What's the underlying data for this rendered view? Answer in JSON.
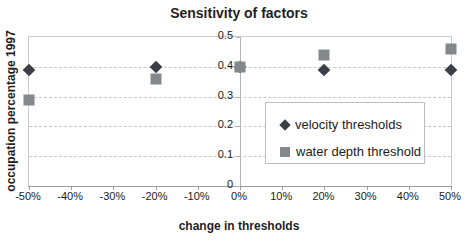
{
  "chart": {
    "title": "Sensitivity of factors",
    "xlabel": "change in thresholds",
    "ylabel": "occupation percentage 1997"
  },
  "chart_data": {
    "type": "scatter",
    "x": [
      -50,
      -20,
      0,
      20,
      50
    ],
    "series": [
      {
        "name": "velocity thresholds",
        "marker": "diamond",
        "color": "#3b3e45",
        "values": [
          0.39,
          0.4,
          0.4,
          0.39,
          0.39
        ]
      },
      {
        "name": "water depth threshold",
        "marker": "square",
        "color": "#85878b",
        "values": [
          0.29,
          0.36,
          0.4,
          0.44,
          0.46
        ]
      }
    ],
    "xlim": [
      -50,
      50
    ],
    "ylim": [
      0,
      0.5
    ],
    "x_ticks": [
      {
        "value": -50,
        "label": "-50%"
      },
      {
        "value": -40,
        "label": "-40%"
      },
      {
        "value": -30,
        "label": "-30%"
      },
      {
        "value": -20,
        "label": "-20%"
      },
      {
        "value": -10,
        "label": "-10%"
      },
      {
        "value": 0,
        "label": "0%"
      },
      {
        "value": 10,
        "label": "10%"
      },
      {
        "value": 20,
        "label": "20%"
      },
      {
        "value": 30,
        "label": "30%"
      },
      {
        "value": 40,
        "label": "40%"
      },
      {
        "value": 50,
        "label": "50%"
      }
    ],
    "y_ticks": [
      {
        "value": 0,
        "label": "0"
      },
      {
        "value": 0.1,
        "label": "0.1"
      },
      {
        "value": 0.2,
        "label": "0.2"
      },
      {
        "value": 0.3,
        "label": "0.3"
      },
      {
        "value": 0.4,
        "label": "0.4"
      },
      {
        "value": 0.5,
        "label": "0.5"
      }
    ],
    "grid": "horizontal-dashed",
    "value_axis_at_x": 0,
    "legend_position": "inside-right"
  },
  "colors": {
    "gridline": "#c8c8c8",
    "plot_border": "#cbcbcb",
    "category_axis": "#9b9b9b",
    "value_axis": "#b4b4b4",
    "legend_border": "#bdbdbd",
    "text": "#1c1c1c",
    "background": "#ffffff"
  }
}
